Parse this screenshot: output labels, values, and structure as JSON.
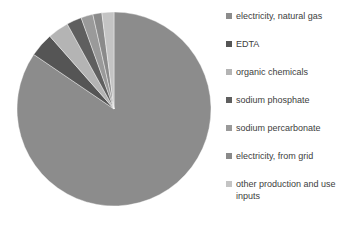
{
  "chart_data": {
    "type": "pie",
    "title": "",
    "categories": [
      "electricity, natural gas",
      "EDTA",
      "organic chemicals",
      "sodium phosphate",
      "sodium percarbonate",
      "electricity, from grid",
      "other production and use inputs"
    ],
    "values": [
      84.5,
      4.0,
      3.5,
      2.5,
      2.0,
      1.5,
      2.0
    ],
    "colors": [
      "#8c8c8c",
      "#555555",
      "#b4b4b4",
      "#5f5f5f",
      "#9a9a9a",
      "#8a8a8a",
      "#c4c4c4"
    ],
    "start_angle": 0,
    "direction": "clockwise",
    "legend_position": "right"
  },
  "legend": {
    "items": [
      {
        "label": "electricity, natural gas",
        "color": "#8c8c8c"
      },
      {
        "label": "EDTA",
        "color": "#555555"
      },
      {
        "label": "organic chemicals",
        "color": "#b4b4b4"
      },
      {
        "label": "sodium phosphate",
        "color": "#5f5f5f"
      },
      {
        "label": "sodium percarbonate",
        "color": "#9a9a9a"
      },
      {
        "label": "electricity, from grid",
        "color": "#8a8a8a"
      },
      {
        "label": "other production and use inputs",
        "color": "#c4c4c4"
      }
    ]
  }
}
